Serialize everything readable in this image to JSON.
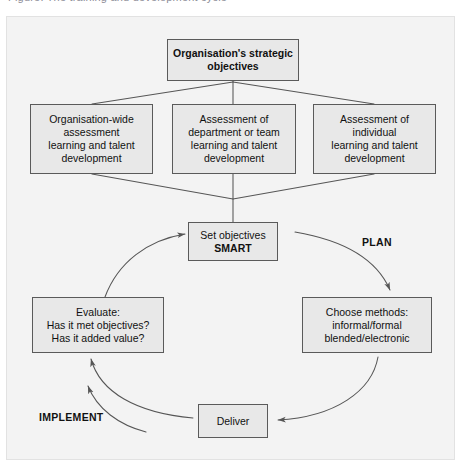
{
  "caption": {
    "text": "Figure: The training and development cycle"
  },
  "colors": {
    "frame_background": "#f3f3f3",
    "node_fill": "#e8e8e8",
    "node_border": "#5a5a5a",
    "connector": "#565656",
    "text": "#111111"
  },
  "diagram": {
    "type": "flow-cycle",
    "nodes": {
      "strategic": {
        "name": "organisations-strategic-objectives",
        "bold": true,
        "lines": [
          "Organisation's strategic",
          "objectives"
        ]
      },
      "org_wide": {
        "name": "organisation-wide-assessment",
        "bold": false,
        "lines": [
          "Organisation-wide",
          "assessment",
          "learning and talent",
          "development"
        ]
      },
      "department": {
        "name": "assessment-of-department-or-team",
        "bold": false,
        "lines": [
          "Assessment of",
          "department or team",
          "learning and talent",
          "development"
        ]
      },
      "individual": {
        "name": "assessment-of-individual",
        "bold": false,
        "lines": [
          "Assessment of",
          "individual",
          "learning and talent",
          "development"
        ]
      },
      "set_objectives": {
        "name": "set-objectives-smart",
        "lines": [
          "Set objectives",
          "SMART"
        ],
        "bold_lines": [
          false,
          true
        ]
      },
      "evaluate": {
        "name": "evaluate",
        "bold": false,
        "lines": [
          "Evaluate:",
          "Has it met objectives?",
          "Has it added value?"
        ]
      },
      "choose_methods": {
        "name": "choose-methods",
        "bold": false,
        "lines": [
          "Choose methods:",
          "informal/formal",
          "blended/electronic"
        ]
      },
      "deliver": {
        "name": "deliver",
        "bold": false,
        "lines": [
          "Deliver"
        ]
      }
    },
    "phase_labels": {
      "plan": "PLAN",
      "implement": "IMPLEMENT"
    },
    "connectors": [
      {
        "from": "strategic",
        "to": "org_wide",
        "style": "line"
      },
      {
        "from": "strategic",
        "to": "department",
        "style": "line"
      },
      {
        "from": "strategic",
        "to": "individual",
        "style": "line"
      },
      {
        "from": "org_wide",
        "to": "set_objectives",
        "style": "line"
      },
      {
        "from": "department",
        "to": "set_objectives",
        "style": "line"
      },
      {
        "from": "individual",
        "to": "set_objectives",
        "style": "line"
      },
      {
        "from": "set_objectives",
        "to": "choose_methods",
        "style": "curved-arrow",
        "phase": "PLAN"
      },
      {
        "from": "choose_methods",
        "to": "deliver",
        "style": "curved-arrow"
      },
      {
        "from": "deliver",
        "to": "evaluate",
        "style": "curved-arrow",
        "phase": "IMPLEMENT"
      },
      {
        "from": "evaluate",
        "to": "set_objectives",
        "style": "curved-arrow"
      }
    ]
  }
}
